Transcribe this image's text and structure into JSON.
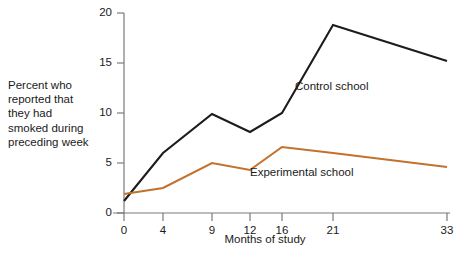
{
  "chart_data": {
    "type": "line",
    "title": "",
    "xlabel": "Months of study",
    "ylabel": "Percent who reported that they had smoked during preceding week",
    "x": [
      0,
      4,
      9,
      12,
      16,
      21,
      33
    ],
    "xtick_labels": [
      "0",
      "4",
      "9",
      "12",
      "16",
      "21",
      "33"
    ],
    "ytick_labels": [
      "0",
      "5",
      "10",
      "15",
      "20"
    ],
    "yticks": [
      0,
      5,
      10,
      15,
      20
    ],
    "ylim": [
      0,
      20
    ],
    "grid": false,
    "legend_position": "inline-annotation",
    "series": [
      {
        "name": "Control school",
        "color": "#1c1c1c",
        "values": [
          1.2,
          6.0,
          9.9,
          8.1,
          10.0,
          18.8,
          15.2
        ]
      },
      {
        "name": "Experimental school",
        "color": "#c1722e",
        "values": [
          1.9,
          2.5,
          5.0,
          4.3,
          6.6,
          6.0,
          4.6
        ]
      }
    ],
    "annotations": [
      {
        "text": "Control school",
        "series": "Control school"
      },
      {
        "text": "Experimental school",
        "series": "Experimental school"
      }
    ]
  },
  "axis": {
    "y_caption_lines": [
      "Percent who",
      "reported that",
      "they had",
      "smoked during",
      "preceding week"
    ],
    "y_caption_text": "Percent who reported that they had smoked during preceding week",
    "x_title": "Months of study"
  },
  "colors": {
    "background": "#ffffff",
    "axis": "#7a7a7a",
    "control_series": "#1c1c1c",
    "experimental_series": "#c1722e",
    "text": "#1a1a1a"
  }
}
